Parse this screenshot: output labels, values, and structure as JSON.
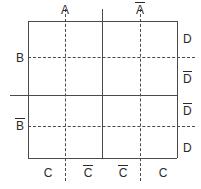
{
  "diagram": {
    "kind": "karnaugh-map",
    "variables": [
      "A",
      "B",
      "C",
      "D"
    ],
    "colors": {
      "line": "#4a4a4a",
      "text": "#2b2b2b",
      "background": "#ffffff"
    },
    "labels": {
      "top": [
        {
          "id": "a",
          "text": "A",
          "overbar": false
        },
        {
          "id": "abar",
          "text": "A",
          "overbar": true
        }
      ],
      "bottom": [
        {
          "id": "c1",
          "text": "C",
          "overbar": false
        },
        {
          "id": "c2",
          "text": "C",
          "overbar": true
        },
        {
          "id": "c3",
          "text": "C",
          "overbar": true
        },
        {
          "id": "c4",
          "text": "C",
          "overbar": false
        }
      ],
      "left": [
        {
          "id": "b",
          "text": "B",
          "overbar": false
        },
        {
          "id": "bbar",
          "text": "B",
          "overbar": true
        }
      ],
      "right": [
        {
          "id": "d1",
          "text": "D",
          "overbar": false
        },
        {
          "id": "d2",
          "text": "D",
          "overbar": true
        },
        {
          "id": "d3",
          "text": "D",
          "overbar": true
        },
        {
          "id": "d4",
          "text": "D",
          "overbar": false
        }
      ]
    }
  }
}
